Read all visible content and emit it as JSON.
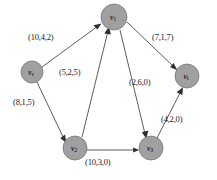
{
  "diagram": {
    "type": "directed-graph",
    "node_fill": "#a0a0a0",
    "node_stroke": "#6f6f6f",
    "edge_color": "#4a4a4a",
    "background": "#ffffff",
    "nodes": [
      {
        "id": "v1",
        "base": "v",
        "sub": "1",
        "cx": 114,
        "cy": 17,
        "r": 13
      },
      {
        "id": "vs",
        "base": "v",
        "sub": "s",
        "cx": 32,
        "cy": 72,
        "r": 11
      },
      {
        "id": "vt",
        "base": "v",
        "sub": "t",
        "cx": 187,
        "cy": 76,
        "r": 12
      },
      {
        "id": "v2",
        "base": "v",
        "sub": "2",
        "cx": 75,
        "cy": 148,
        "r": 12
      },
      {
        "id": "v3",
        "base": "v",
        "sub": "3",
        "cx": 151,
        "cy": 148,
        "r": 12
      }
    ],
    "edges": [
      {
        "id": "vs-v1",
        "from": "vs",
        "to": "v1",
        "label": "(10,4,2)",
        "capacity": 10,
        "cost": 4,
        "flow": 2,
        "label_x": 28,
        "label_y": 32
      },
      {
        "id": "v2-v1",
        "from": "v2",
        "to": "v1",
        "label": "(5,2,5)",
        "capacity": 5,
        "cost": 2,
        "flow": 5,
        "label_x": 59,
        "label_y": 67
      },
      {
        "id": "vs-v2",
        "from": "vs",
        "to": "v2",
        "label": "(8,1,5)",
        "capacity": 8,
        "cost": 1,
        "flow": 5,
        "label_x": 13,
        "label_y": 97
      },
      {
        "id": "v1-vt",
        "from": "v1",
        "to": "vt",
        "label": "(7,1,7)",
        "capacity": 7,
        "cost": 1,
        "flow": 7,
        "label_x": 152,
        "label_y": 32
      },
      {
        "id": "v1-v3",
        "from": "v1",
        "to": "v3",
        "label": "(2,6,0)",
        "capacity": 2,
        "cost": 6,
        "flow": 0,
        "label_x": 129,
        "label_y": 77
      },
      {
        "id": "v3-vt",
        "from": "v3",
        "to": "vt",
        "label": "(4,2,0)",
        "capacity": 4,
        "cost": 2,
        "flow": 0,
        "label_x": 161,
        "label_y": 114
      },
      {
        "id": "v2-v3",
        "from": "v2",
        "to": "v3",
        "label": "(10,3,0)",
        "capacity": 10,
        "cost": 3,
        "flow": 0,
        "label_x": 85,
        "label_y": 157
      }
    ]
  }
}
